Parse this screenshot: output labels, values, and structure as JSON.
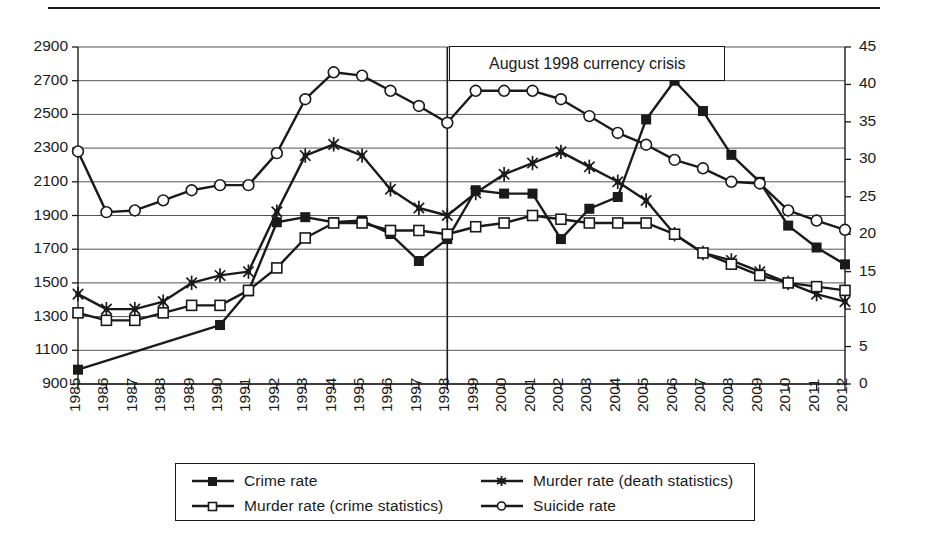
{
  "figure": {
    "annotation": "August 1998 currency crisis",
    "annotation_year": 1998,
    "top_rule": true
  },
  "legend": {
    "entries": [
      {
        "label": "Crime rate",
        "marker": "filled-square",
        "axis": "left"
      },
      {
        "label": "Murder rate (death statistics)",
        "marker": "asterisk",
        "axis": "right"
      },
      {
        "label": "Murder rate (crime statistics)",
        "marker": "open-square",
        "axis": "right"
      },
      {
        "label": "Suicide rate",
        "marker": "open-circle",
        "axis": "right"
      }
    ]
  },
  "chart_data": {
    "type": "line",
    "title": "",
    "xlabel": "",
    "ylabel": "",
    "grid": true,
    "legend_position": "bottom",
    "x": [
      1985,
      1986,
      1987,
      1988,
      1989,
      1990,
      1991,
      1992,
      1993,
      1994,
      1995,
      1996,
      1997,
      1998,
      1999,
      2000,
      2001,
      2002,
      2003,
      2004,
      2005,
      2006,
      2007,
      2008,
      2009,
      2010,
      2011,
      2012
    ],
    "xtick_labels": [
      "1985",
      "1986",
      "1987",
      "1988",
      "1989",
      "1990",
      "1991",
      "1992",
      "1993",
      "1994",
      "1995",
      "1996",
      "1997",
      "1998",
      "1999",
      "2000",
      "2001",
      "2002",
      "2003",
      "2004",
      "2005",
      "2006",
      "2007",
      "2008",
      "2009",
      "2010",
      "2011",
      "2012"
    ],
    "left_axis": {
      "label": "",
      "ylim": [
        900,
        2900
      ],
      "ticks": [
        900,
        1100,
        1300,
        1500,
        1700,
        1900,
        2100,
        2300,
        2500,
        2700,
        2900
      ],
      "tick_labels": [
        "900",
        "1100",
        "1300",
        "1500",
        "1700",
        "1900",
        "2100",
        "2300",
        "2500",
        "2700",
        "2900"
      ]
    },
    "right_axis": {
      "label": "",
      "ylim": [
        0,
        45
      ],
      "ticks": [
        0,
        5,
        10,
        15,
        20,
        25,
        30,
        35,
        40,
        45
      ],
      "tick_labels": [
        "0",
        "5",
        "10",
        "15",
        "20",
        "25",
        "30",
        "35",
        "40",
        "45"
      ]
    },
    "series": [
      {
        "name": "Crime rate",
        "axis": "left",
        "marker": "filled-square",
        "color": "#1a1a1a",
        "values": [
          985,
          null,
          null,
          null,
          null,
          1250,
          1450,
          1860,
          1890,
          1860,
          1870,
          1790,
          1630,
          1760,
          2050,
          2030,
          2030,
          1760,
          1940,
          2010,
          2470,
          2700,
          2520,
          2260,
          2100,
          1840,
          1710,
          1610
        ]
      },
      {
        "name": "Murder rate (death statistics)",
        "axis": "right",
        "marker": "asterisk",
        "color": "#1a1a1a",
        "values": [
          12.0,
          10.0,
          10.0,
          11.0,
          13.5,
          14.5,
          15.0,
          23.0,
          30.5,
          32.0,
          30.5,
          26.0,
          23.5,
          22.5,
          25.5,
          28.0,
          29.5,
          31.0,
          29.0,
          27.0,
          24.5,
          20.0,
          17.5,
          16.5,
          15.0,
          13.5,
          12.0,
          11.0
        ]
      },
      {
        "name": "Murder rate (crime statistics)",
        "axis": "right",
        "marker": "open-square",
        "color": "#1a1a1a",
        "values": [
          9.5,
          8.5,
          8.5,
          9.5,
          10.5,
          10.5,
          12.5,
          15.5,
          19.5,
          21.5,
          21.5,
          20.5,
          20.5,
          20.0,
          21.0,
          21.5,
          22.5,
          22.0,
          21.5,
          21.5,
          21.5,
          20.0,
          17.5,
          16.0,
          14.5,
          13.5,
          13.0,
          12.5
        ]
      },
      {
        "name": "Suicide rate",
        "axis": "left",
        "marker": "open-circle",
        "color": "#1a1a1a",
        "values": [
          2280,
          1920,
          1930,
          1990,
          2050,
          2080,
          2080,
          2270,
          2590,
          2750,
          2730,
          2640,
          2550,
          2450,
          2640,
          2640,
          2640,
          2590,
          2490,
          2390,
          2320,
          2230,
          2180,
          2100,
          2090,
          1930,
          1870,
          1815
        ]
      }
    ]
  }
}
